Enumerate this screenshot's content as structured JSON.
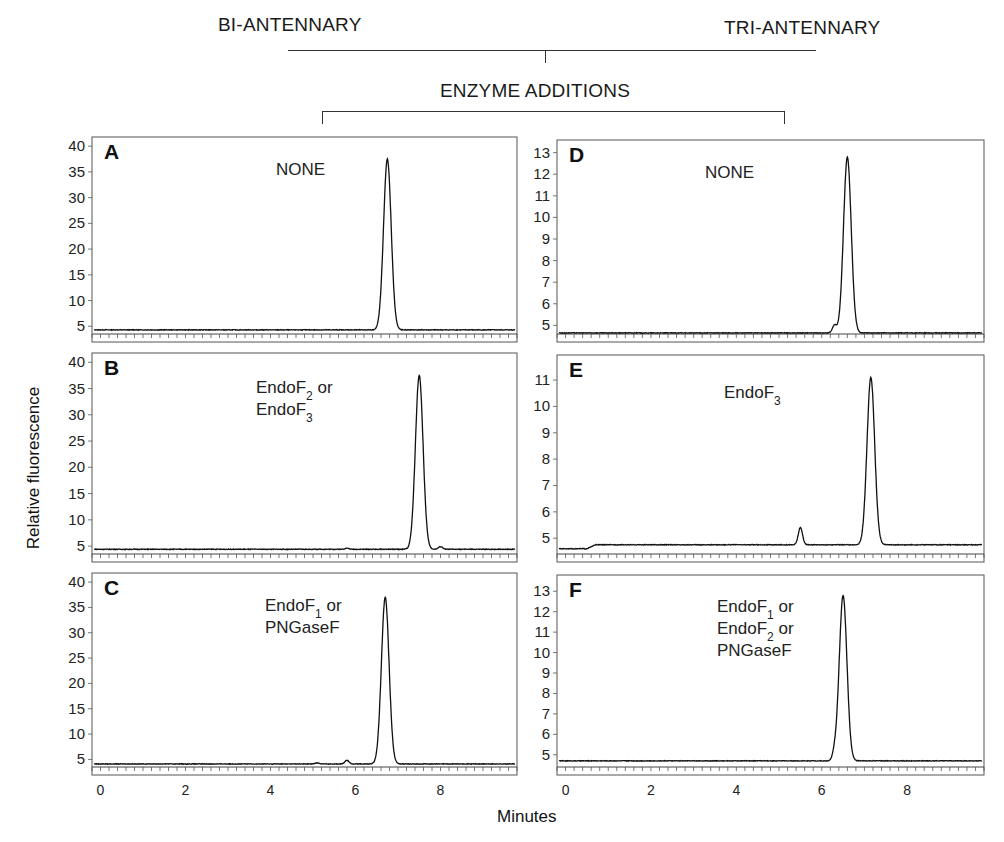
{
  "header": {
    "left_group": "BI-ANTENNARY",
    "right_group": "TRI-ANTENNARY",
    "enzyme_label": "ENZYME ADDITIONS"
  },
  "axes": {
    "ylabel": "Relative fluorescence",
    "xlabel": "Minutes"
  },
  "chart_data": [
    {
      "type": "line",
      "panel": "A",
      "group": "BI-ANTENNARY",
      "annotation": [
        "NONE"
      ],
      "xlabel": "Minutes",
      "ylabel": "Relative fluorescence",
      "xlim": [
        -0.2,
        9.8
      ],
      "ylim": [
        3.5,
        41
      ],
      "yticks": [
        5,
        10,
        15,
        20,
        25,
        30,
        35,
        40
      ],
      "xticks": [
        0,
        2,
        4,
        6,
        8
      ],
      "baseline": 4.3,
      "peaks": [
        {
          "x": 6.75,
          "y": 37.5
        }
      ]
    },
    {
      "type": "line",
      "panel": "B",
      "group": "BI-ANTENNARY",
      "annotation": [
        "EndoF2 or",
        "EndoF3"
      ],
      "xlabel": "Minutes",
      "ylabel": "Relative fluorescence",
      "xlim": [
        -0.2,
        9.8
      ],
      "ylim": [
        3.5,
        41
      ],
      "yticks": [
        5,
        10,
        15,
        20,
        25,
        30,
        35,
        40
      ],
      "xticks": [
        0,
        2,
        4,
        6,
        8
      ],
      "baseline": 4.4,
      "peaks": [
        {
          "x": 5.8,
          "y": 4.6
        },
        {
          "x": 7.5,
          "y": 37.5
        },
        {
          "x": 8.0,
          "y": 4.9
        }
      ]
    },
    {
      "type": "line",
      "panel": "C",
      "group": "BI-ANTENNARY",
      "annotation": [
        "EndoF1 or",
        "PNGaseF"
      ],
      "xlabel": "Minutes",
      "ylabel": "Relative fluorescence",
      "xlim": [
        -0.2,
        9.8
      ],
      "ylim": [
        3.5,
        41
      ],
      "yticks": [
        5,
        10,
        15,
        20,
        25,
        30,
        35,
        40
      ],
      "xticks": [
        0,
        2,
        4,
        6,
        8
      ],
      "baseline": 4.1,
      "peaks": [
        {
          "x": 5.1,
          "y": 4.3
        },
        {
          "x": 5.8,
          "y": 4.8
        },
        {
          "x": 6.7,
          "y": 37
        }
      ]
    },
    {
      "type": "line",
      "panel": "D",
      "group": "TRI-ANTENNARY",
      "annotation": [
        "NONE"
      ],
      "xlabel": "Minutes",
      "ylabel": "Relative fluorescence",
      "xlim": [
        -0.2,
        9.8
      ],
      "ylim": [
        4.6,
        13.4
      ],
      "yticks": [
        5,
        6,
        7,
        8,
        9,
        10,
        11,
        12,
        13
      ],
      "xticks": [
        0,
        2,
        4,
        6,
        8
      ],
      "baseline": 4.65,
      "peaks": [
        {
          "x": 6.3,
          "y": 5.0
        },
        {
          "x": 6.6,
          "y": 12.8
        }
      ]
    },
    {
      "type": "line",
      "panel": "E",
      "group": "TRI-ANTENNARY",
      "annotation": [
        "EndoF3"
      ],
      "xlabel": "Minutes",
      "ylabel": "Relative fluorescence",
      "xlim": [
        -0.2,
        9.8
      ],
      "ylim": [
        4.4,
        11.8
      ],
      "yticks": [
        5,
        6,
        7,
        8,
        9,
        10,
        11
      ],
      "xticks": [
        0,
        2,
        4,
        6,
        8
      ],
      "baseline": 4.75,
      "peaks": [
        {
          "x": 5.5,
          "y": 5.4
        },
        {
          "x": 7.15,
          "y": 11.1
        }
      ]
    },
    {
      "type": "line",
      "panel": "F",
      "group": "TRI-ANTENNARY",
      "annotation": [
        "EndoF1 or",
        "EndoF2 or",
        "PNGaseF"
      ],
      "xlabel": "Minutes",
      "ylabel": "Relative fluorescence",
      "xlim": [
        -0.2,
        9.8
      ],
      "ylim": [
        4.4,
        13.6
      ],
      "yticks": [
        5,
        6,
        7,
        8,
        9,
        10,
        11,
        12,
        13
      ],
      "xticks": [
        0,
        2,
        4,
        6,
        8
      ],
      "baseline": 4.7,
      "peaks": [
        {
          "x": 6.3,
          "y": 5.0
        },
        {
          "x": 6.5,
          "y": 12.8
        }
      ]
    }
  ]
}
